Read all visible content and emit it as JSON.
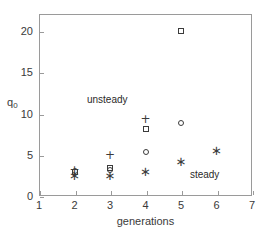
{
  "chart_data": {
    "type": "scatter",
    "title": "",
    "xlabel": "generations",
    "ylabel": "q_0",
    "ylabel_base": "q",
    "ylabel_sub": "0",
    "xlim": [
      1,
      7
    ],
    "ylim": [
      0,
      21.5
    ],
    "xticks": [
      1,
      2,
      3,
      4,
      5,
      6,
      7
    ],
    "yticks": [
      0,
      5,
      10,
      15,
      20
    ],
    "xtick_labels": [
      "1",
      "2",
      "3",
      "4",
      "5",
      "6",
      "7"
    ],
    "ytick_labels": [
      "0",
      "5",
      "10",
      "15",
      "20"
    ],
    "grid": false,
    "legend": "none",
    "series": [
      {
        "name": "plus",
        "marker": "+",
        "color": "#3b3b3b",
        "points": [
          {
            "x": 2,
            "y": 3.2
          },
          {
            "x": 3,
            "y": 5.0
          },
          {
            "x": 4,
            "y": 9.3
          }
        ]
      },
      {
        "name": "square",
        "marker": "square",
        "color": "#3b3b3b",
        "points": [
          {
            "x": 2,
            "y": 2.9
          },
          {
            "x": 3,
            "y": 3.4
          },
          {
            "x": 4,
            "y": 8.1
          },
          {
            "x": 5,
            "y": 20.0
          }
        ]
      },
      {
        "name": "circle",
        "marker": "circle",
        "color": "#3b3b3b",
        "points": [
          {
            "x": 2,
            "y": 3.0
          },
          {
            "x": 3,
            "y": 3.1
          },
          {
            "x": 4,
            "y": 5.3
          },
          {
            "x": 5,
            "y": 8.8
          }
        ]
      },
      {
        "name": "asterisk",
        "marker": "*",
        "color": "#3b3b3b",
        "points": [
          {
            "x": 2,
            "y": 2.6
          },
          {
            "x": 3,
            "y": 2.5
          },
          {
            "x": 4,
            "y": 3.0
          },
          {
            "x": 5,
            "y": 4.2
          },
          {
            "x": 6,
            "y": 5.6
          }
        ]
      }
    ],
    "annotations": [
      {
        "text": "unsteady",
        "x": 2.35,
        "y": 11.6
      },
      {
        "text": "steady",
        "x": 5.25,
        "y": 2.6
      }
    ]
  },
  "colors": {
    "axis": "#9a9a9a",
    "text": "#3a3a3a",
    "marker": "#3b3b3b",
    "background": "#ffffff"
  }
}
